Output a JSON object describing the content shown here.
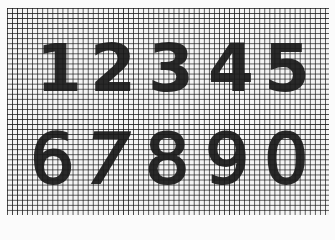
{
  "image": {
    "description": "Handwritten-style digits 1-9 and 0 drawn over square graph paper grid",
    "background_color": "#fbfbfb",
    "grid_line_color": "#141414",
    "ink_color": "#1a1a1a"
  },
  "digits": {
    "row1": [
      "1",
      "2",
      "3",
      "4",
      "5"
    ],
    "row2": [
      "6",
      "7",
      "8",
      "9",
      "0"
    ]
  }
}
